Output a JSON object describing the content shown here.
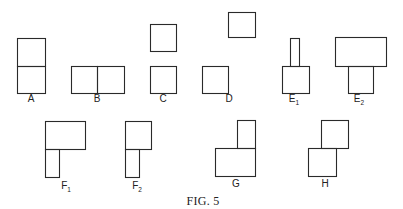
{
  "figure": {
    "caption": "FIG. 5",
    "caption_pos": [
      203,
      205
    ],
    "stroke_color": "#2a2a2a",
    "background": "#ffffff"
  },
  "items": [
    {
      "id": "A",
      "label": "A",
      "sub": "",
      "label_pos": [
        31,
        102
      ],
      "rects": [
        [
          17,
          38,
          28,
          28
        ],
        [
          17,
          66,
          28,
          27
        ]
      ]
    },
    {
      "id": "B",
      "label": "B",
      "sub": "",
      "label_pos": [
        97,
        102
      ],
      "rects": [
        [
          71,
          66,
          26,
          27
        ],
        [
          97,
          66,
          27,
          27
        ]
      ]
    },
    {
      "id": "C",
      "label": "C",
      "sub": "",
      "label_pos": [
        163,
        102
      ],
      "rects": [
        [
          150,
          24,
          26,
          27
        ],
        [
          150,
          66,
          26,
          27
        ]
      ]
    },
    {
      "id": "D",
      "label": "D",
      "sub": "",
      "label_pos": [
        229,
        102
      ],
      "rects": [
        [
          228,
          12,
          27,
          25
        ],
        [
          202,
          66,
          26,
          27
        ]
      ]
    },
    {
      "id": "E1",
      "label": "E",
      "sub": "1",
      "label_pos": [
        294,
        102
      ],
      "rects": [
        [
          290,
          38,
          9,
          28
        ],
        [
          282,
          66,
          27,
          27
        ]
      ]
    },
    {
      "id": "E2",
      "label": "E",
      "sub": "2",
      "label_pos": [
        359,
        102
      ],
      "rects": [
        [
          335,
          37,
          51,
          29
        ],
        [
          348,
          66,
          25,
          27
        ]
      ]
    },
    {
      "id": "F1",
      "label": "F",
      "sub": "1",
      "label_pos": [
        66,
        189
      ],
      "rects": [
        [
          45,
          121,
          40,
          28
        ],
        [
          45,
          149,
          14,
          28
        ]
      ]
    },
    {
      "id": "F2",
      "label": "F",
      "sub": "2",
      "label_pos": [
        137,
        189
      ],
      "rects": [
        [
          125,
          121,
          26,
          28
        ],
        [
          125,
          149,
          14,
          28
        ]
      ]
    },
    {
      "id": "G",
      "label": "G",
      "sub": "",
      "label_pos": [
        236,
        187
      ],
      "rects": [
        [
          237,
          120,
          18,
          28
        ],
        [
          215,
          148,
          40,
          28
        ]
      ]
    },
    {
      "id": "H",
      "label": "H",
      "sub": "",
      "label_pos": [
        325,
        187
      ],
      "rects": [
        [
          321,
          120,
          27,
          28
        ],
        [
          308,
          148,
          28,
          28
        ]
      ]
    }
  ]
}
